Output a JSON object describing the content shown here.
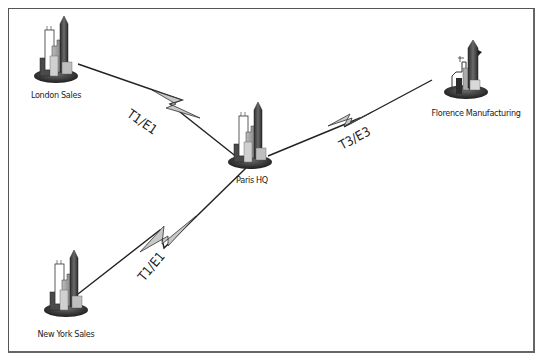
{
  "diagram": {
    "type": "wan-topology",
    "nodes": [
      {
        "id": "london",
        "label": "London Sales",
        "icon": "city-buildings-icon"
      },
      {
        "id": "paris",
        "label": "Paris HQ",
        "icon": "city-buildings-icon"
      },
      {
        "id": "florence",
        "label": "Florence Manufacturing",
        "icon": "factory-icon"
      },
      {
        "id": "newyork",
        "label": "New York Sales",
        "icon": "city-buildings-icon"
      }
    ],
    "links": [
      {
        "from": "london",
        "to": "paris",
        "label": "T1/E1",
        "style": "lightning-bolt"
      },
      {
        "from": "paris",
        "to": "florence",
        "label": "T3/E3",
        "style": "lightning-bolt"
      },
      {
        "from": "newyork",
        "to": "paris",
        "label": "T1/E1",
        "style": "lightning-bolt"
      }
    ],
    "colors": {
      "line": "#222222",
      "bolt_fill": "#c8c8c8",
      "building_dark": "#4a4a4a",
      "building_mid": "#9a9a9a",
      "building_light": "#d8d8d8",
      "base": "#3a3a3a"
    }
  }
}
